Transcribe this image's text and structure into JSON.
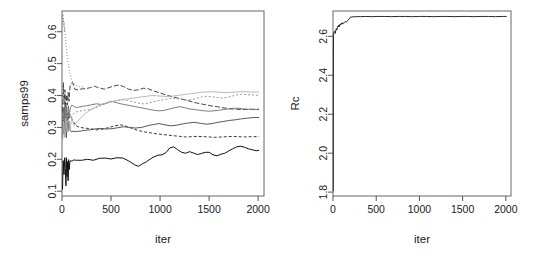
{
  "figure": {
    "background": "#ffffff",
    "axis_color": "#555555",
    "text_color": "#1a1a1a",
    "panel_count": 2
  },
  "chart_data": [
    {
      "type": "line",
      "panel": "left",
      "title": "",
      "xlabel": "iter",
      "ylabel": "samps99",
      "xlim": [
        0,
        2060
      ],
      "ylim": [
        0.085,
        0.665
      ],
      "xticks": [
        0,
        500,
        1000,
        1500,
        2000
      ],
      "xtick_labels": [
        "0",
        "500",
        "1000",
        "1500",
        "2000"
      ],
      "yticks": [
        0.1,
        0.2,
        0.3,
        0.4,
        0.5,
        0.6
      ],
      "ytick_labels": [
        "0.1",
        "0.2",
        "0.3",
        "0.4",
        "0.5",
        "0.6"
      ],
      "grid": false,
      "legend": "none",
      "n_series": 8,
      "series": [
        {
          "name": "chain-1",
          "color": "#111111",
          "dash": "none",
          "width": 1.0,
          "x": [
            5,
            12,
            20,
            28,
            34,
            40,
            46,
            52,
            58,
            62,
            68,
            74,
            80,
            88,
            100,
            120,
            150,
            200,
            260,
            320,
            380,
            440,
            500,
            560,
            620,
            680,
            740,
            780,
            820,
            860,
            900,
            940,
            980,
            1020,
            1060,
            1100,
            1140,
            1180,
            1220,
            1260,
            1300,
            1340,
            1380,
            1420,
            1460,
            1500,
            1540,
            1580,
            1620,
            1660,
            1700,
            1740,
            1780,
            1820,
            1860,
            1900,
            1940,
            1980,
            2010
          ],
          "y": [
            0.105,
            0.196,
            0.152,
            0.205,
            0.172,
            0.117,
            0.205,
            0.146,
            0.193,
            0.133,
            0.199,
            0.168,
            0.191,
            0.196,
            0.194,
            0.198,
            0.197,
            0.197,
            0.2,
            0.197,
            0.203,
            0.204,
            0.201,
            0.205,
            0.204,
            0.195,
            0.183,
            0.178,
            0.186,
            0.192,
            0.201,
            0.208,
            0.213,
            0.214,
            0.221,
            0.236,
            0.239,
            0.23,
            0.222,
            0.219,
            0.224,
            0.22,
            0.215,
            0.218,
            0.222,
            0.222,
            0.214,
            0.211,
            0.216,
            0.219,
            0.226,
            0.233,
            0.239,
            0.241,
            0.238,
            0.233,
            0.23,
            0.227,
            0.228
          ]
        },
        {
          "name": "chain-2",
          "color": "#222222",
          "dash": "3,2",
          "width": 0.9,
          "x": [
            5,
            12,
            20,
            28,
            34,
            40,
            46,
            52,
            58,
            64,
            70,
            76,
            84,
            92,
            110,
            140,
            180,
            230,
            290,
            350,
            420,
            480,
            540,
            600,
            660,
            720,
            780,
            840,
            900,
            960,
            1020,
            1080,
            1140,
            1200,
            1260,
            1320,
            1380,
            1440,
            1500,
            1560,
            1620,
            1680,
            1740,
            1800,
            1860,
            1920,
            1980,
            2010
          ],
          "y": [
            0.3,
            0.355,
            0.315,
            0.362,
            0.33,
            0.302,
            0.341,
            0.318,
            0.35,
            0.322,
            0.344,
            0.33,
            0.338,
            0.333,
            0.32,
            0.306,
            0.3,
            0.298,
            0.296,
            0.292,
            0.295,
            0.3,
            0.305,
            0.308,
            0.303,
            0.296,
            0.29,
            0.286,
            0.283,
            0.28,
            0.278,
            0.276,
            0.274,
            0.272,
            0.27,
            0.271,
            0.272,
            0.271,
            0.27,
            0.269,
            0.27,
            0.271,
            0.272,
            0.271,
            0.27,
            0.271,
            0.271,
            0.271
          ]
        },
        {
          "name": "chain-3",
          "color": "#444444",
          "dash": "none",
          "width": 0.9,
          "x": [
            5,
            12,
            20,
            28,
            36,
            44,
            52,
            60,
            70,
            80,
            95,
            115,
            140,
            170,
            200,
            210,
            240,
            280,
            330,
            390,
            450,
            510,
            570,
            630,
            690,
            750,
            810,
            870,
            930,
            990,
            1050,
            1110,
            1170,
            1230,
            1290,
            1350,
            1410,
            1470,
            1530,
            1590,
            1650,
            1710,
            1770,
            1830,
            1890,
            1950,
            2010
          ],
          "y": [
            0.262,
            0.33,
            0.28,
            0.342,
            0.295,
            0.268,
            0.318,
            0.288,
            0.32,
            0.292,
            0.286,
            0.288,
            0.287,
            0.288,
            0.289,
            0.29,
            0.291,
            0.292,
            0.295,
            0.297,
            0.295,
            0.296,
            0.299,
            0.302,
            0.3,
            0.298,
            0.3,
            0.305,
            0.309,
            0.312,
            0.308,
            0.305,
            0.307,
            0.311,
            0.314,
            0.316,
            0.313,
            0.31,
            0.312,
            0.316,
            0.319,
            0.322,
            0.324,
            0.327,
            0.329,
            0.331,
            0.331
          ]
        },
        {
          "name": "chain-4",
          "color": "#333333",
          "dash": "5,2",
          "width": 0.9,
          "x": [
            5,
            14,
            22,
            30,
            38,
            46,
            54,
            62,
            72,
            82,
            95,
            110,
            130,
            155,
            185,
            215,
            250,
            290,
            330,
            380,
            430,
            480,
            530,
            580,
            630,
            680,
            730,
            780,
            830,
            880,
            930,
            980,
            1030,
            1080,
            1130,
            1180,
            1230,
            1280,
            1330,
            1380,
            1430,
            1480,
            1530,
            1580,
            1630,
            1680,
            1730,
            1780,
            1830,
            1880,
            1930,
            1980,
            2010
          ],
          "y": [
            0.35,
            0.44,
            0.372,
            0.418,
            0.36,
            0.402,
            0.37,
            0.41,
            0.382,
            0.43,
            0.438,
            0.44,
            0.42,
            0.418,
            0.42,
            0.421,
            0.422,
            0.425,
            0.429,
            0.424,
            0.42,
            0.425,
            0.43,
            0.433,
            0.428,
            0.42,
            0.416,
            0.418,
            0.423,
            0.421,
            0.415,
            0.41,
            0.405,
            0.4,
            0.396,
            0.392,
            0.388,
            0.384,
            0.38,
            0.376,
            0.373,
            0.37,
            0.367,
            0.365,
            0.362,
            0.36,
            0.358,
            0.357,
            0.356,
            0.356,
            0.357,
            0.357,
            0.357
          ]
        },
        {
          "name": "chain-5",
          "color": "#6e6e6e",
          "dash": "none",
          "width": 0.9,
          "x": [
            5,
            14,
            22,
            30,
            38,
            46,
            54,
            64,
            74,
            86,
            100,
            120,
            145,
            175,
            210,
            250,
            300,
            350,
            400,
            450,
            500,
            550,
            600,
            650,
            700,
            750,
            800,
            850,
            900,
            950,
            1000,
            1050,
            1100,
            1150,
            1200,
            1250,
            1300,
            1350,
            1400,
            1450,
            1500,
            1550,
            1600,
            1650,
            1700,
            1750,
            1800,
            1850,
            1900,
            1950,
            2010
          ],
          "y": [
            0.3,
            0.362,
            0.318,
            0.372,
            0.33,
            0.365,
            0.325,
            0.368,
            0.34,
            0.362,
            0.37,
            0.366,
            0.362,
            0.364,
            0.366,
            0.368,
            0.371,
            0.374,
            0.372,
            0.376,
            0.382,
            0.378,
            0.374,
            0.371,
            0.368,
            0.365,
            0.362,
            0.359,
            0.356,
            0.353,
            0.352,
            0.354,
            0.358,
            0.362,
            0.365,
            0.362,
            0.358,
            0.356,
            0.354,
            0.352,
            0.351,
            0.352,
            0.354,
            0.356,
            0.358,
            0.36,
            0.36,
            0.358,
            0.357,
            0.356,
            0.356
          ]
        },
        {
          "name": "chain-6",
          "color": "#8c8c8c",
          "dash": "2,2",
          "width": 0.9,
          "x": [
            5,
            14,
            24,
            34,
            44,
            54,
            66,
            78,
            92,
            110,
            135,
            165,
            200,
            240,
            285,
            330,
            380,
            430,
            480,
            530,
            580,
            630,
            680,
            730,
            780,
            830,
            880,
            930,
            980,
            1030,
            1080,
            1130,
            1180,
            1230,
            1280,
            1330,
            1380,
            1430,
            1480,
            1530,
            1580,
            1630,
            1680,
            1730,
            1780,
            1830,
            1880,
            1930,
            1980,
            2010
          ],
          "y": [
            0.285,
            0.345,
            0.3,
            0.355,
            0.312,
            0.348,
            0.318,
            0.352,
            0.33,
            0.34,
            0.348,
            0.35,
            0.352,
            0.354,
            0.356,
            0.36,
            0.366,
            0.372,
            0.378,
            0.382,
            0.384,
            0.386,
            0.384,
            0.38,
            0.376,
            0.374,
            0.376,
            0.38,
            0.384,
            0.386,
            0.39,
            0.392,
            0.39,
            0.388,
            0.386,
            0.388,
            0.392,
            0.396,
            0.398,
            0.396,
            0.394,
            0.392,
            0.394,
            0.398,
            0.402,
            0.404,
            0.403,
            0.402,
            0.401,
            0.401
          ]
        },
        {
          "name": "chain-7",
          "color": "#b0b0b0",
          "dash": "none",
          "width": 0.9,
          "x": [
            5,
            16,
            28,
            40,
            52,
            66,
            82,
            100,
            125,
            155,
            190,
            230,
            275,
            320,
            370,
            420,
            470,
            520,
            570,
            620,
            670,
            720,
            770,
            820,
            870,
            920,
            970,
            1020,
            1070,
            1120,
            1170,
            1220,
            1270,
            1320,
            1370,
            1420,
            1470,
            1520,
            1570,
            1620,
            1670,
            1720,
            1770,
            1820,
            1870,
            1920,
            1970,
            2010
          ],
          "y": [
            0.25,
            0.32,
            0.268,
            0.33,
            0.282,
            0.325,
            0.292,
            0.33,
            0.305,
            0.318,
            0.33,
            0.342,
            0.352,
            0.36,
            0.368,
            0.374,
            0.378,
            0.382,
            0.385,
            0.388,
            0.39,
            0.392,
            0.394,
            0.396,
            0.398,
            0.4,
            0.399,
            0.398,
            0.397,
            0.398,
            0.4,
            0.402,
            0.404,
            0.406,
            0.408,
            0.41,
            0.411,
            0.412,
            0.411,
            0.41,
            0.409,
            0.41,
            0.411,
            0.412,
            0.412,
            0.411,
            0.411,
            0.411
          ]
        },
        {
          "name": "chain-8-burnin",
          "color": "#777777",
          "dash": "1,2",
          "width": 0.9,
          "x": [
            4,
            7,
            10,
            13,
            16,
            19,
            22,
            25,
            28,
            32,
            36,
            40,
            45,
            50,
            56,
            62,
            68,
            74,
            82,
            90,
            100,
            112,
            126,
            142,
            160,
            180,
            200,
            215
          ],
          "y": [
            0.65,
            0.64,
            0.655,
            0.628,
            0.642,
            0.615,
            0.63,
            0.6,
            0.612,
            0.586,
            0.575,
            0.56,
            0.548,
            0.53,
            0.512,
            0.5,
            0.492,
            0.48,
            0.468,
            0.458,
            0.448,
            0.44,
            0.436,
            0.432,
            0.43,
            0.428,
            0.427,
            0.427
          ]
        }
      ]
    },
    {
      "type": "line",
      "panel": "right",
      "title": "",
      "xlabel": "iter",
      "ylabel": "Rc",
      "xlim": [
        0,
        2060
      ],
      "ylim": [
        1.78,
        2.73
      ],
      "xticks": [
        0,
        500,
        1000,
        1500,
        2000
      ],
      "xtick_labels": [
        "0",
        "500",
        "1000",
        "1500",
        "2000"
      ],
      "yticks": [
        1.8,
        2.0,
        2.2,
        2.4,
        2.6
      ],
      "ytick_labels": [
        "1.8",
        "2.0",
        "2.2",
        "2.4",
        "2.6"
      ],
      "grid": false,
      "legend": "none",
      "n_series": 1,
      "series": [
        {
          "name": "Rc",
          "color": "#111111",
          "dash": "none",
          "width": 0.9,
          "x": [
            3,
            4,
            6,
            9,
            14,
            20,
            26,
            32,
            38,
            44,
            50,
            56,
            62,
            68,
            74,
            80,
            88,
            96,
            104,
            112,
            122,
            132,
            142,
            152,
            162,
            172,
            182,
            200,
            230,
            270,
            320,
            380,
            450,
            520,
            600,
            680,
            760,
            840,
            920,
            1000,
            1080,
            1160,
            1240,
            1320,
            1400,
            1480,
            1560,
            1640,
            1720,
            1800,
            1880,
            1960,
            2010
          ],
          "y": [
            1.805,
            2.48,
            2.605,
            2.618,
            2.622,
            2.626,
            2.615,
            2.63,
            2.64,
            2.632,
            2.645,
            2.652,
            2.648,
            2.658,
            2.65,
            2.662,
            2.658,
            2.668,
            2.662,
            2.67,
            2.666,
            2.672,
            2.676,
            2.672,
            2.678,
            2.682,
            2.686,
            2.698,
            2.7,
            2.701,
            2.701,
            2.702,
            2.701,
            2.702,
            2.702,
            2.701,
            2.702,
            2.702,
            2.701,
            2.702,
            2.702,
            2.701,
            2.702,
            2.702,
            2.701,
            2.702,
            2.702,
            2.701,
            2.702,
            2.702,
            2.701,
            2.702,
            2.702
          ]
        }
      ]
    }
  ]
}
